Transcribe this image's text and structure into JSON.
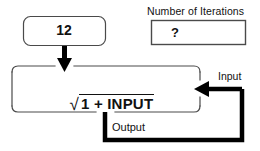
{
  "diagram": {
    "type": "feedback-loop-flow-diagram",
    "seed_box": {
      "value": "12",
      "shape": "rounded-rectangle",
      "stroke": "#4a4a4a"
    },
    "iterations_box": {
      "label": "Number of Iterations",
      "value": "?",
      "shape": "rectangle",
      "stroke": "#4a4a4a"
    },
    "process_box": {
      "formula_radical": "√",
      "formula_radicand": "1 + INPUT",
      "formula_text": "√(1 + INPUT)",
      "shape": "rounded-rectangle",
      "stroke": "#4a4a4a"
    },
    "connectors": {
      "seed_arrow": {
        "name": "down-arrow",
        "direction": "down",
        "color": "#000000"
      },
      "input_arrow": {
        "label": "Input",
        "direction": "left",
        "color": "#000000"
      },
      "output_path": {
        "label": "Output",
        "direction": "down-right-up",
        "color": "#000000"
      }
    },
    "colors": {
      "ink": "#111111",
      "thin_stroke": "#4a4a4a",
      "thick_stroke": "#000000",
      "background": "#ffffff"
    }
  }
}
